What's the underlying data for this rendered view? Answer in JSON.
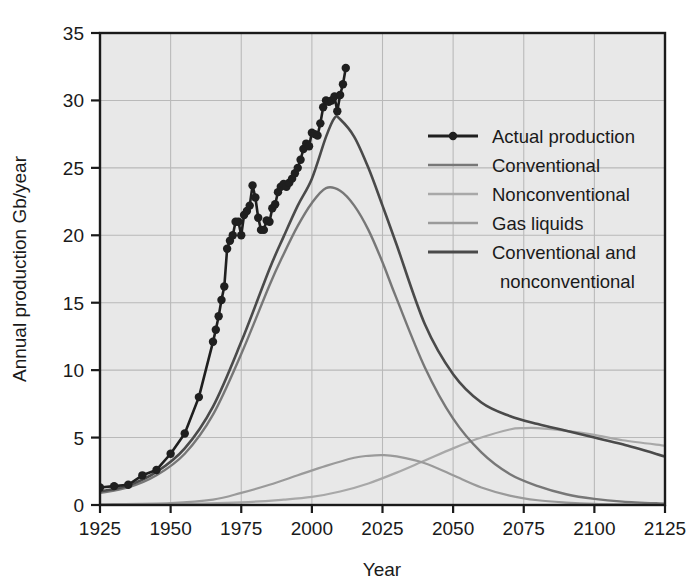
{
  "chart_data": {
    "type": "line",
    "title": "",
    "xlabel": "Year",
    "ylabel": "Annual production Gb/year",
    "xlim": [
      1925,
      2125
    ],
    "ylim": [
      0,
      35
    ],
    "xticks": [
      1925,
      1950,
      1975,
      2000,
      2025,
      2050,
      2075,
      2100,
      2125
    ],
    "yticks": [
      0,
      5,
      10,
      15,
      20,
      25,
      30,
      35
    ],
    "grid": true,
    "legend_position": "upper-right-inside",
    "plot_background": "#e8e8e8",
    "series": [
      {
        "name": "Actual production",
        "color": "#1f1f1f",
        "width": 2.6,
        "markers": true,
        "marker_size": 4.2,
        "x": [
          1925,
          1930,
          1935,
          1940,
          1945,
          1950,
          1955,
          1960,
          1965,
          1966,
          1967,
          1968,
          1969,
          1970,
          1971,
          1972,
          1973,
          1974,
          1975,
          1976,
          1977,
          1978,
          1979,
          1980,
          1981,
          1982,
          1983,
          1984,
          1985,
          1986,
          1987,
          1988,
          1989,
          1990,
          1991,
          1992,
          1993,
          1994,
          1995,
          1996,
          1997,
          1998,
          1999,
          2000,
          2001,
          2002,
          2003,
          2004,
          2005,
          2006,
          2007,
          2008,
          2009,
          2010,
          2011,
          2012
        ],
        "y": [
          1.3,
          1.4,
          1.5,
          2.2,
          2.6,
          3.8,
          5.3,
          8.0,
          12.1,
          13.0,
          14.0,
          15.2,
          16.2,
          19.0,
          19.6,
          20.0,
          21.0,
          21.0,
          20.0,
          21.5,
          21.8,
          22.2,
          23.7,
          22.8,
          21.3,
          20.4,
          20.4,
          21.1,
          21.0,
          22.0,
          22.3,
          23.2,
          23.6,
          23.8,
          23.6,
          23.9,
          24.2,
          24.6,
          25.0,
          25.6,
          26.4,
          26.8,
          26.6,
          27.6,
          27.5,
          27.4,
          28.3,
          29.5,
          30.0,
          29.9,
          30.0,
          30.3,
          29.2,
          30.4,
          31.2,
          32.4
        ]
      },
      {
        "name": "Conventional",
        "color": "#777777",
        "width": 2.4,
        "markers": false,
        "x": [
          1925,
          1935,
          1945,
          1955,
          1965,
          1975,
          1985,
          1990,
          1995,
          2000,
          2005,
          2010,
          2015,
          2020,
          2025,
          2030,
          2040,
          2050,
          2060,
          2070,
          2080,
          2090,
          2100,
          2110,
          2125
        ],
        "y": [
          0.9,
          1.3,
          2.2,
          3.8,
          6.7,
          11.2,
          16.3,
          18.6,
          20.7,
          22.4,
          23.5,
          23.3,
          22.2,
          20.4,
          18.0,
          15.3,
          10.2,
          6.4,
          3.9,
          2.3,
          1.4,
          0.8,
          0.45,
          0.25,
          0.1
        ]
      },
      {
        "name": "Nonconventional",
        "color": "#a8a8a8",
        "width": 2.2,
        "markers": false,
        "x": [
          1925,
          1950,
          1975,
          1990,
          2000,
          2010,
          2020,
          2030,
          2040,
          2050,
          2060,
          2070,
          2075,
          2080,
          2090,
          2100,
          2110,
          2125
        ],
        "y": [
          0.02,
          0.06,
          0.2,
          0.4,
          0.6,
          1.0,
          1.6,
          2.4,
          3.3,
          4.2,
          5.0,
          5.6,
          5.7,
          5.7,
          5.5,
          5.2,
          4.8,
          4.4
        ]
      },
      {
        "name": "Gas liquids",
        "color": "#9a9a9a",
        "width": 2.2,
        "markers": false,
        "x": [
          1925,
          1950,
          1965,
          1975,
          1985,
          1995,
          2005,
          2015,
          2020,
          2025,
          2030,
          2040,
          2050,
          2060,
          2070,
          2080,
          2090,
          2100,
          2110,
          2125
        ],
        "y": [
          0.05,
          0.15,
          0.4,
          0.9,
          1.5,
          2.2,
          2.9,
          3.5,
          3.65,
          3.7,
          3.6,
          3.1,
          2.2,
          1.3,
          0.7,
          0.35,
          0.18,
          0.08,
          0.04,
          0.01
        ]
      },
      {
        "name": "Conventional and nonconventional",
        "color": "#4a4a4a",
        "width": 2.6,
        "markers": false,
        "x": [
          1925,
          1935,
          1945,
          1955,
          1965,
          1975,
          1985,
          1990,
          1995,
          2000,
          2005,
          2008,
          2010,
          2015,
          2020,
          2025,
          2030,
          2040,
          2050,
          2060,
          2070,
          2080,
          2090,
          2100,
          2110,
          2125
        ],
        "y": [
          1.0,
          1.45,
          2.45,
          4.2,
          7.3,
          12.1,
          17.5,
          19.9,
          22.2,
          24.2,
          27.3,
          28.7,
          28.6,
          27.3,
          25.0,
          22.2,
          19.3,
          13.4,
          9.7,
          7.6,
          6.6,
          6.0,
          5.5,
          5.0,
          4.5,
          3.6
        ]
      }
    ]
  },
  "legend": {
    "entries": [
      {
        "label": "Actual production",
        "icon": "line-with-dot-swatch"
      },
      {
        "label": "Conventional",
        "icon": "line-swatch"
      },
      {
        "label": "Nonconventional",
        "icon": "line-swatch"
      },
      {
        "label": "Gas liquids",
        "icon": "line-swatch"
      },
      {
        "label": "Conventional and",
        "icon": "line-swatch"
      },
      {
        "label": "nonconventional",
        "icon": "none"
      }
    ]
  },
  "axes": {
    "x_title": "Year",
    "y_title": "Annual production Gb/year",
    "x_tick_labels": [
      "1925",
      "1950",
      "1975",
      "2000",
      "2025",
      "2050",
      "2075",
      "2100",
      "2125"
    ],
    "y_tick_labels": [
      "0",
      "5",
      "10",
      "15",
      "20",
      "25",
      "30",
      "35"
    ]
  },
  "colors": {
    "plot_bg": "#e8e8e8",
    "page_bg": "#ffffff",
    "grid": "#b9b9b9",
    "frame": "#1a1a1a",
    "text": "#1a1a1a"
  }
}
